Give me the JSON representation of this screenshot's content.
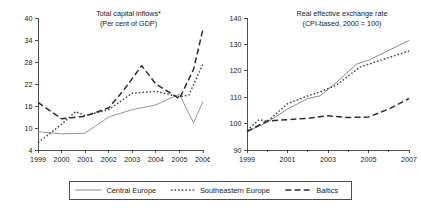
{
  "figure": {
    "background": "#ffffff",
    "ink": "#1a1a1a"
  },
  "legend": {
    "name": "series-legend",
    "entries": [
      {
        "label": "Central Europe",
        "style": "solid",
        "color": "#8a8a8a",
        "dash": "none"
      },
      {
        "label": "Southeastern Europe",
        "style": "dotted",
        "color": "#4a4a4a",
        "dash": "1.6 2.0"
      },
      {
        "label": "Baltics",
        "style": "dashed",
        "color": "#2e2e2e",
        "dash": "6 3.2"
      }
    ]
  },
  "chart_data": [
    {
      "id": "total-capital-inflows",
      "type": "line",
      "title": "Total capital inflows*",
      "subtitle": "(Per cent of GDP)",
      "xlabel": "",
      "ylabel": "",
      "grid": false,
      "legend_position": "below-figure",
      "x": [
        1999,
        2000,
        2001,
        2002,
        2003,
        2004,
        2005,
        2006
      ],
      "xtick_labels": [
        "1999",
        "2000",
        "2001",
        "2002",
        "2003",
        "2004",
        "2005",
        "2006"
      ],
      "xlim": [
        1999,
        2006
      ],
      "ylim": [
        4,
        40
      ],
      "ytick_labels": [
        "4",
        "10",
        "16",
        "22",
        "28",
        "34",
        "40"
      ],
      "yticks": [
        4,
        10,
        16,
        22,
        28,
        34,
        40
      ],
      "series": [
        {
          "name": "Central Europe",
          "color": "#8a8a8a",
          "dash": "none",
          "width": 0.9,
          "values": [
            9.0,
            8.4,
            8.6,
            13.0,
            15.0,
            16.3,
            19.2,
            11.4,
            17.3
          ],
          "x": [
            1999,
            2000,
            2001,
            2002,
            2003,
            2004,
            2005,
            2005.6,
            2006
          ]
        },
        {
          "name": "Southeastern Europe",
          "color": "#4a4a4a",
          "dash": "1.6 2.0",
          "width": 1.5,
          "values": [
            6.0,
            11.0,
            14.5,
            13.4,
            15.0,
            19.5,
            20.0,
            18.5,
            19.0,
            27.5
          ],
          "x": [
            1999,
            2000,
            2000.6,
            2001,
            2002,
            2003,
            2004,
            2005,
            2005.4,
            2006
          ]
        },
        {
          "name": "Baltics",
          "color": "#2e2e2e",
          "dash": "6 3.2",
          "width": 1.5,
          "values": [
            17.0,
            12.5,
            13.2,
            15.5,
            20.0,
            27.0,
            22.0,
            18.0,
            26.0,
            37.0
          ],
          "x": [
            1999,
            2000,
            2001,
            2002,
            2002.6,
            2003.4,
            2004,
            2005,
            2005.6,
            2006
          ]
        }
      ]
    },
    {
      "id": "real-effective-exchange-rate",
      "type": "line",
      "title": "Real effective exchange rate",
      "subtitle": "(CPI-based, 2000 = 100)",
      "xlabel": "",
      "ylabel": "",
      "grid": false,
      "legend_position": "below-figure",
      "x": [
        1999,
        2000,
        2001,
        2002,
        2003,
        2004,
        2005,
        2006,
        2007
      ],
      "xtick_labels": [
        "1999",
        "",
        "2001",
        "",
        "2003",
        "",
        "2005",
        "",
        "2007"
      ],
      "xlim": [
        1999,
        2007
      ],
      "ylim": [
        90,
        140
      ],
      "ytick_labels": [
        "90",
        "100",
        "110",
        "120",
        "130",
        "140"
      ],
      "yticks": [
        90,
        100,
        110,
        120,
        130,
        140
      ],
      "series": [
        {
          "name": "Central Europe",
          "color": "#8a8a8a",
          "dash": "none",
          "width": 1.0,
          "values": [
            97.0,
            100.5,
            105.5,
            109.5,
            110.5,
            115.5,
            122.5,
            124.0,
            131.5
          ],
          "x": [
            1999,
            2000,
            2001,
            2002,
            2002.6,
            2003.4,
            2004.4,
            2005,
            2007
          ]
        },
        {
          "name": "Southeastern Europe",
          "color": "#4a4a4a",
          "dash": "1.6 2.0",
          "width": 1.5,
          "values": [
            97.5,
            101.5,
            100.8,
            107.5,
            110.5,
            112.0,
            114.5,
            121.5,
            122.5,
            127.5
          ],
          "x": [
            1999,
            1999.6,
            2000,
            2001,
            2002,
            2002.6,
            2003.4,
            2004.6,
            2005,
            2007
          ]
        },
        {
          "name": "Baltics",
          "color": "#2e2e2e",
          "dash": "6 3.2",
          "width": 1.5,
          "values": [
            97.0,
            101.0,
            101.5,
            102.0,
            103.0,
            102.3,
            102.5,
            105.5,
            109.5
          ],
          "x": [
            1999,
            2000,
            2001,
            2002,
            2003,
            2004,
            2005,
            2006,
            2007
          ]
        }
      ]
    }
  ]
}
